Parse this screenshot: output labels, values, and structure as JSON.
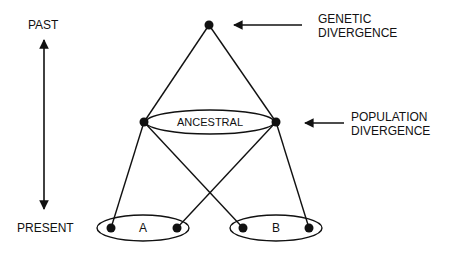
{
  "labels": {
    "past": "PAST",
    "present": "PRESENT",
    "genetic_line1": "GENETIC",
    "genetic_line2": "DIVERGENCE",
    "population_line1": "POPULATION",
    "population_line2": "DIVERGENCE",
    "ancestral": "ANCESTRAL",
    "pop_a": "A",
    "pop_b": "B"
  },
  "colors": {
    "ink": "#111111",
    "background": "#ffffff"
  }
}
